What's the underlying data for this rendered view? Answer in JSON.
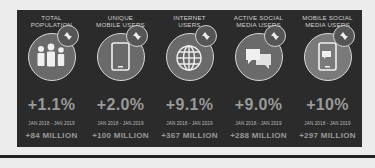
{
  "panel": {
    "background": "#2b2b2b",
    "stats": [
      {
        "title_line1": "TOTAL",
        "title_line2": "POPULATION",
        "icon": "people-icon",
        "change_pct": "+1.1%",
        "period": "JAN 2018 - JAN 2019",
        "change_abs": "+84 MILLION"
      },
      {
        "title_line1": "UNIQUE",
        "title_line2": "MOBILE USERS",
        "icon": "mobile-phone-icon",
        "change_pct": "+2.0%",
        "period": "JAN 2018 - JAN 2019",
        "change_abs": "+100 MILLION"
      },
      {
        "title_line1": "INTERNET",
        "title_line2": "USERS",
        "icon": "globe-icon",
        "change_pct": "+9.1%",
        "period": "JAN 2018 - JAN 2019",
        "change_abs": "+367 MILLION"
      },
      {
        "title_line1": "ACTIVE SOCIAL",
        "title_line2": "MEDIA USERS",
        "icon": "chat-bubbles-icon",
        "change_pct": "+9.0%",
        "period": "JAN 2018 - JAN 2019",
        "change_abs": "+288 MILLION"
      },
      {
        "title_line1": "MOBILE SOCIAL",
        "title_line2": "MEDIA USERS",
        "icon": "mobile-chat-icon",
        "change_pct": "+10%",
        "period": "JAN 2018 - JAN 2019",
        "change_abs": "+297 MILLION"
      }
    ]
  }
}
